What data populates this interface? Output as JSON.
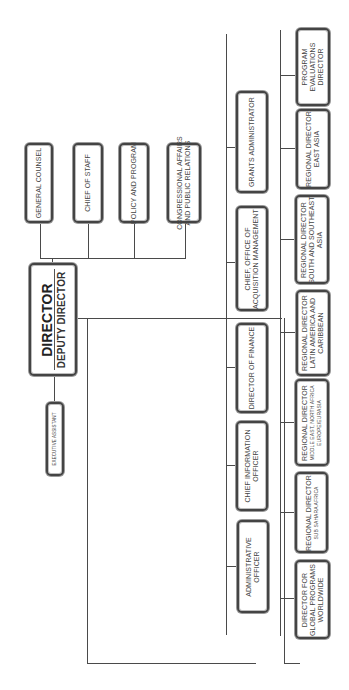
{
  "chart": {
    "orientation": "rotated-90-ccw",
    "top_level": {
      "title": "DIRECTOR",
      "subtitle": "DEPUTY DIRECTOR"
    },
    "executive_assistant": "EXECUTIVE ASSISTANT",
    "advisors": [
      {
        "lines": [
          "GENERAL COUNSEL"
        ]
      },
      {
        "lines": [
          "CHIEF OF STAFF"
        ]
      },
      {
        "lines": [
          "POLICY AND PROGRAM"
        ]
      },
      {
        "lines": [
          "CONGRESSIONAL AFFAIRS",
          "AND PUBLIC RELATIONS"
        ]
      }
    ],
    "staff_offices": [
      {
        "lines": [
          "GRANTS ADMINISTRATOR"
        ]
      },
      {
        "lines": [
          "CHIEF, OFFICE OF",
          "ACQUISITION MANAGEMENT"
        ]
      },
      {
        "lines": [
          "DIRECTOR OF FINANCE"
        ]
      },
      {
        "lines": [
          "CHIEF INFORMATION",
          "OFFICER"
        ]
      },
      {
        "lines": [
          "ADMINISTRATIVE",
          "OFFICER"
        ]
      }
    ],
    "program_offices": [
      {
        "lines": [
          "PROGRAM",
          "EVALUATIONS",
          "DIRECTOR"
        ]
      },
      {
        "lines": [
          "REGIONAL DIRECTOR",
          "EAST ASIA"
        ]
      },
      {
        "lines": [
          "REGIONAL DIRECTOR",
          "SOUTH AND SOUTHEAST",
          "ASIA"
        ]
      },
      {
        "lines": [
          "REGIONAL DIRECTOR",
          "LATIN AMERICA AND",
          "CARIBBEAN"
        ]
      },
      {
        "lines": [
          "REGIONAL DIRECTOR",
          "MIDDLE EAST, NORTH AFRICA",
          "EUROPE/EURASIA"
        ]
      },
      {
        "lines": [
          "REGIONAL DIRECTOR",
          "SUB SAHARA AFRICA"
        ]
      },
      {
        "lines": [
          "DIRECTOR FOR",
          "GLOBAL PROGRAMS",
          "WORLDWIDE"
        ]
      }
    ]
  }
}
